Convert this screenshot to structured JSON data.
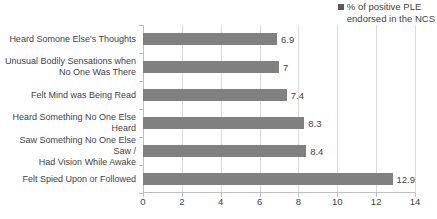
{
  "legend": {
    "label": "% of positive PLE\nendorsed in the NCS",
    "marker_color": "#595959",
    "position": "top-right"
  },
  "chart_data": {
    "type": "bar",
    "orientation": "horizontal",
    "title": "",
    "xlabel": "",
    "ylabel": "",
    "grid": true,
    "xlim": [
      0,
      14
    ],
    "xticks": [
      0,
      2,
      4,
      6,
      8,
      10,
      12,
      14
    ],
    "series_name": "% of positive PLE endorsed in the NCS",
    "bar_color": "#808080",
    "categories": [
      "Heard Somone Else's Thoughts",
      "Unusual Bodily Sensations when\nNo One Was  There",
      "Felt Mind was Being Read",
      "Heard Something No One Else\nHeard",
      "Saw Something No One Else Saw /\nHad Vision While Awake",
      "Felt Spied Upon or Followed"
    ],
    "values": [
      6.9,
      7,
      7.4,
      8.3,
      8.4,
      12.9
    ],
    "value_labels": [
      "6.9",
      "7",
      "7.4",
      "8.3",
      "8.4",
      "12.9"
    ]
  }
}
